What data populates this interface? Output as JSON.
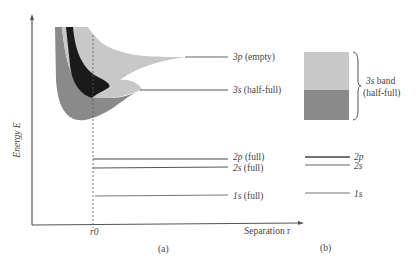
{
  "axes": {
    "y_label": "Energy E",
    "x_label": "Separation r",
    "r0_label": "r0"
  },
  "levels_a": [
    {
      "orbital": "3p",
      "state": "(empty)"
    },
    {
      "orbital": "3s",
      "state": "(half-full)"
    },
    {
      "orbital": "2p",
      "state": "(full)"
    },
    {
      "orbital": "2s",
      "state": "(full)"
    },
    {
      "orbital": "1s",
      "state": "(full)"
    }
  ],
  "levels_b": [
    "2p",
    "2s",
    "1s"
  ],
  "band_b": {
    "line1": "3s band",
    "line2": "(half-full)"
  },
  "panel_labels": {
    "a": "(a)",
    "b": "(b)"
  },
  "colors": {
    "light": "#c8c8c8",
    "mid": "#8a8a8a",
    "dark": "#1a1a1a",
    "line": "#555555"
  }
}
